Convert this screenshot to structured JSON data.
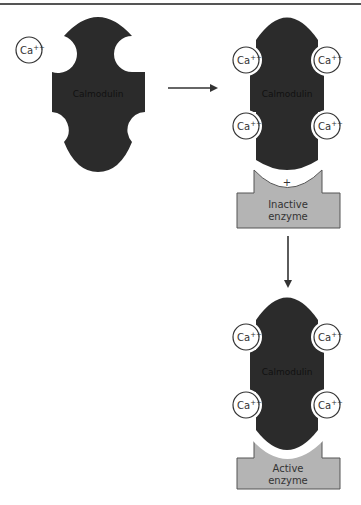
{
  "figure": {
    "colors": {
      "calmodulin": "#2b2b2b",
      "enzyme": "#b4b4b4",
      "enzyme_border": "#555555",
      "ion_fill": "#ffffff",
      "ion_border": "#333333",
      "arrow": "#333333"
    },
    "free_ion": {
      "label": "Ca",
      "charge": "++"
    },
    "stage1": {
      "protein_label": "Calmodulin"
    },
    "stage2": {
      "protein_label": "Calmodulin",
      "ions": [
        {
          "label": "Ca",
          "charge": "++"
        },
        {
          "label": "Ca",
          "charge": "++"
        },
        {
          "label": "Ca",
          "charge": "++"
        },
        {
          "label": "Ca",
          "charge": "++"
        }
      ],
      "plus_sign": "+",
      "enzyme_label_line1": "Inactive",
      "enzyme_label_line2": "enzyme"
    },
    "stage3": {
      "protein_label": "Calmodulin",
      "ions": [
        {
          "label": "Ca",
          "charge": "++"
        },
        {
          "label": "Ca",
          "charge": "++"
        },
        {
          "label": "Ca",
          "charge": "++"
        },
        {
          "label": "Ca",
          "charge": "++"
        }
      ],
      "enzyme_label_line1": "Active",
      "enzyme_label_line2": "enzyme"
    },
    "arrows": [
      {
        "direction": "right"
      },
      {
        "direction": "down"
      }
    ]
  }
}
